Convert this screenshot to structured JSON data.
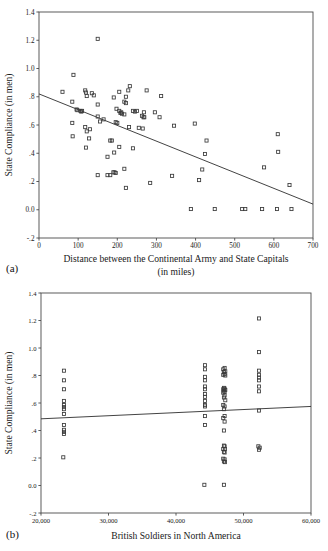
{
  "figure": {
    "panel_a_label": "(a)",
    "panel_b_label": "(b)"
  },
  "chart_data": [
    {
      "id": "a",
      "type": "scatter",
      "title": "",
      "xlabel": "Distance between the Continental Army and State Capitals",
      "xlabel_line2": "(in miles)",
      "ylabel": "State Compliance (in men)",
      "xlim": [
        0,
        700
      ],
      "ylim": [
        -0.2,
        1.4
      ],
      "xticks": [
        0,
        100,
        200,
        300,
        400,
        500,
        600,
        700
      ],
      "xticklabels": [
        "0",
        "100",
        "200",
        "300",
        "400",
        "500",
        "600",
        "700"
      ],
      "yticks": [
        -0.2,
        0.0,
        0.2,
        0.4,
        0.6,
        0.8,
        1.0,
        1.2,
        1.4
      ],
      "yticklabels": [
        "-.2",
        "0.0",
        ".2",
        ".4",
        ".6",
        ".8",
        "1.0",
        "1.2",
        "1.4"
      ],
      "grid": false,
      "legend": "none",
      "marker": "open-square",
      "fit_line": {
        "x0": 0,
        "y0": 0.82,
        "x1": 700,
        "y1": 0.04
      },
      "points": [
        [
          150,
          1.21
        ],
        [
          88,
          0.955
        ],
        [
          60,
          0.835
        ],
        [
          232,
          0.875
        ],
        [
          228,
          0.845
        ],
        [
          205,
          0.835
        ],
        [
          118,
          0.845
        ],
        [
          120,
          0.83
        ],
        [
          135,
          0.825
        ],
        [
          140,
          0.81
        ],
        [
          122,
          0.805
        ],
        [
          222,
          0.8
        ],
        [
          191,
          0.795
        ],
        [
          312,
          0.805
        ],
        [
          275,
          0.845
        ],
        [
          85,
          0.765
        ],
        [
          218,
          0.765
        ],
        [
          150,
          0.745
        ],
        [
          222,
          0.755
        ],
        [
          96,
          0.71
        ],
        [
          98,
          0.705
        ],
        [
          106,
          0.7
        ],
        [
          108,
          0.695
        ],
        [
          110,
          0.7
        ],
        [
          198,
          0.715
        ],
        [
          205,
          0.7
        ],
        [
          208,
          0.685
        ],
        [
          210,
          0.69
        ],
        [
          212,
          0.68
        ],
        [
          240,
          0.7
        ],
        [
          245,
          0.695
        ],
        [
          250,
          0.7
        ],
        [
          268,
          0.69
        ],
        [
          296,
          0.69
        ],
        [
          218,
          0.675
        ],
        [
          263,
          0.665
        ],
        [
          267,
          0.655
        ],
        [
          269,
          0.655
        ],
        [
          308,
          0.655
        ],
        [
          150,
          0.66
        ],
        [
          165,
          0.64
        ],
        [
          85,
          0.615
        ],
        [
          200,
          0.615
        ],
        [
          196,
          0.62
        ],
        [
          156,
          0.625
        ],
        [
          230,
          0.585
        ],
        [
          255,
          0.58
        ],
        [
          265,
          0.575
        ],
        [
          345,
          0.595
        ],
        [
          398,
          0.61
        ],
        [
          118,
          0.585
        ],
        [
          130,
          0.57
        ],
        [
          122,
          0.555
        ],
        [
          610,
          0.535
        ],
        [
          86,
          0.52
        ],
        [
          128,
          0.505
        ],
        [
          182,
          0.49
        ],
        [
          186,
          0.49
        ],
        [
          428,
          0.49
        ],
        [
          120,
          0.44
        ],
        [
          205,
          0.445
        ],
        [
          240,
          0.435
        ],
        [
          611,
          0.41
        ],
        [
          424,
          0.395
        ],
        [
          175,
          0.375
        ],
        [
          192,
          0.405
        ],
        [
          218,
          0.29
        ],
        [
          575,
          0.3
        ],
        [
          417,
          0.285
        ],
        [
          190,
          0.265
        ],
        [
          193,
          0.265
        ],
        [
          196,
          0.26
        ],
        [
          150,
          0.245
        ],
        [
          175,
          0.245
        ],
        [
          182,
          0.245
        ],
        [
          340,
          0.24
        ],
        [
          409,
          0.21
        ],
        [
          284,
          0.19
        ],
        [
          640,
          0.175
        ],
        [
          222,
          0.155
        ],
        [
          388,
          0.005
        ],
        [
          449,
          0.005
        ],
        [
          519,
          0.005
        ],
        [
          527,
          0.005
        ],
        [
          570,
          0.005
        ],
        [
          608,
          0.005
        ],
        [
          645,
          0.005
        ]
      ]
    },
    {
      "id": "b",
      "type": "scatter",
      "title": "",
      "xlabel": "British Soldiers in North America",
      "ylabel": "State Compliance (in men)",
      "xlim": [
        20000,
        60000
      ],
      "ylim": [
        -0.2,
        1.4
      ],
      "xticks": [
        20000,
        30000,
        40000,
        50000,
        60000
      ],
      "xticklabels": [
        "20,000",
        "30,000",
        "40,000",
        "50,000",
        "60,000"
      ],
      "yticks": [
        -0.2,
        0.0,
        0.2,
        0.4,
        0.6,
        0.8,
        1.0,
        1.2,
        1.4
      ],
      "yticklabels": [
        "-.2",
        "0.0",
        ".2",
        ".4",
        ".6",
        ".8",
        "1.0",
        "1.2",
        "1.4"
      ],
      "grid": false,
      "legend": "none",
      "marker": "open-square",
      "fit_line": {
        "x0": 20000,
        "y0": 0.485,
        "x1": 60000,
        "y1": 0.575
      },
      "points": [
        [
          23400,
          0.835
        ],
        [
          23400,
          0.765
        ],
        [
          23400,
          0.7
        ],
        [
          23400,
          0.615
        ],
        [
          23400,
          0.585
        ],
        [
          23400,
          0.57
        ],
        [
          23400,
          0.555
        ],
        [
          23400,
          0.52
        ],
        [
          23400,
          0.44
        ],
        [
          23400,
          0.405
        ],
        [
          23400,
          0.39
        ],
        [
          23400,
          0.375
        ],
        [
          23300,
          0.205
        ],
        [
          44300,
          0.875
        ],
        [
          44300,
          0.845
        ],
        [
          44300,
          0.79
        ],
        [
          44300,
          0.765
        ],
        [
          44300,
          0.72
        ],
        [
          44300,
          0.7
        ],
        [
          44300,
          0.665
        ],
        [
          44300,
          0.645
        ],
        [
          44300,
          0.615
        ],
        [
          44300,
          0.585
        ],
        [
          44300,
          0.575
        ],
        [
          44300,
          0.505
        ],
        [
          44300,
          0.44
        ],
        [
          44200,
          0.005
        ],
        [
          47000,
          0.845
        ],
        [
          47200,
          0.855
        ],
        [
          47300,
          0.83
        ],
        [
          47100,
          0.825
        ],
        [
          47200,
          0.81
        ],
        [
          47000,
          0.805
        ],
        [
          47300,
          0.8
        ],
        [
          47100,
          0.71
        ],
        [
          47200,
          0.705
        ],
        [
          47000,
          0.7
        ],
        [
          47300,
          0.695
        ],
        [
          47100,
          0.69
        ],
        [
          47200,
          0.68
        ],
        [
          47000,
          0.675
        ],
        [
          47200,
          0.655
        ],
        [
          47100,
          0.64
        ],
        [
          47300,
          0.62
        ],
        [
          47000,
          0.585
        ],
        [
          47200,
          0.575
        ],
        [
          47100,
          0.555
        ],
        [
          47200,
          0.505
        ],
        [
          47000,
          0.49
        ],
        [
          47200,
          0.465
        ],
        [
          47100,
          0.4
        ],
        [
          47100,
          0.29
        ],
        [
          47200,
          0.285
        ],
        [
          47000,
          0.265
        ],
        [
          47250,
          0.265
        ],
        [
          47100,
          0.245
        ],
        [
          47200,
          0.24
        ],
        [
          47000,
          0.195
        ],
        [
          47200,
          0.19
        ],
        [
          47100,
          0.175
        ],
        [
          47250,
          0.17
        ],
        [
          47100,
          0.005
        ],
        [
          52300,
          1.215
        ],
        [
          52300,
          0.97
        ],
        [
          52300,
          0.835
        ],
        [
          52300,
          0.805
        ],
        [
          52300,
          0.785
        ],
        [
          52300,
          0.765
        ],
        [
          52300,
          0.72
        ],
        [
          52300,
          0.685
        ],
        [
          52300,
          0.545
        ],
        [
          52200,
          0.285
        ],
        [
          52400,
          0.275
        ],
        [
          52300,
          0.26
        ]
      ]
    }
  ]
}
